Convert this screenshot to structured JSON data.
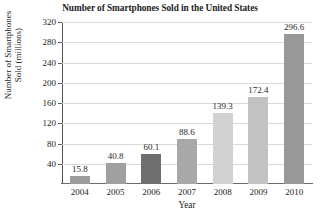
{
  "chart_data": {
    "type": "bar",
    "title": "Number of Smartphones Sold in the United States",
    "xlabel": "Year",
    "ylabel": "Number of Smartphones\nSold (millions)",
    "categories": [
      "2004",
      "2005",
      "2006",
      "2007",
      "2008",
      "2009",
      "2010"
    ],
    "values": [
      15.8,
      40.8,
      60.1,
      88.6,
      139.3,
      172.4,
      296.6
    ],
    "value_labels": [
      "15.8",
      "40.8",
      "60.1",
      "88.6",
      "139.3",
      "172.4",
      "296.6"
    ],
    "bar_colors": [
      "#9c9c9c",
      "#a0a0a0",
      "#6e6e6e",
      "#a8a8a8",
      "#d2d2d2",
      "#c2c2c2",
      "#989898"
    ],
    "ylim": [
      0,
      320
    ],
    "yticks": [
      40,
      80,
      120,
      160,
      200,
      240,
      280,
      320
    ],
    "ytick_labels": [
      "40",
      "80",
      "120",
      "160",
      "200",
      "240",
      "280",
      "320"
    ],
    "grid": "horizontal",
    "legend": "none"
  }
}
